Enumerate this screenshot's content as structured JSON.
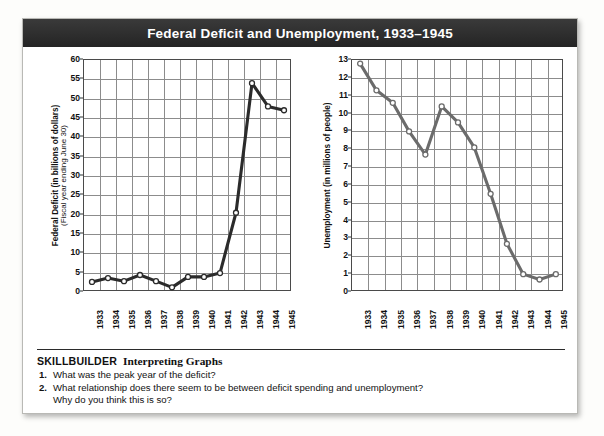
{
  "header": {
    "title": "Federal Deficit and Unemployment, 1933–1945"
  },
  "left_axis": {
    "title": "Federal Deficit (in billions of dollars)",
    "subtitle": "(Fiscal year ending June 30)"
  },
  "right_axis": {
    "title": "Unemployment (in millions of people)"
  },
  "footer": {
    "skillbuilder_label": "SKILLBUILDER",
    "skillbuilder_topic": "Interpreting Graphs",
    "questions": [
      {
        "num": "1.",
        "text": "What was the peak year of the deficit?"
      },
      {
        "num": "2.",
        "text": "What relationship does there seem to be between deficit spending and unemployment?"
      }
    ],
    "question2_line2": "Why do you think this is so?"
  },
  "chart_data": [
    {
      "type": "line",
      "id": "federal-deficit",
      "title": "Federal Deficit (in billions of dollars)",
      "xlabel": "",
      "ylabel": "Federal Deficit (in billions of dollars) (Fiscal year ending June 30)",
      "categories": [
        "1933",
        "1934",
        "1935",
        "1936",
        "1937",
        "1938",
        "1939",
        "1940",
        "1941",
        "1942",
        "1943",
        "1944",
        "1945"
      ],
      "values": [
        2.6,
        3.6,
        2.8,
        4.4,
        2.8,
        1.2,
        3.9,
        3.9,
        4.9,
        20.5,
        54.0,
        48.0,
        47.0
      ],
      "ylim": [
        0,
        60
      ],
      "yticks": [
        0,
        5,
        10,
        15,
        20,
        25,
        30,
        35,
        40,
        45,
        50,
        55,
        60
      ],
      "grid": true,
      "legend": "none",
      "marker": "open-circle",
      "line_color": "#2b2b2b"
    },
    {
      "type": "line",
      "id": "unemployment",
      "title": "Unemployment (in millions of people)",
      "xlabel": "",
      "ylabel": "Unemployment (in millions of people)",
      "categories": [
        "1933",
        "1934",
        "1935",
        "1936",
        "1937",
        "1938",
        "1939",
        "1940",
        "1941",
        "1942",
        "1943",
        "1944",
        "1945"
      ],
      "values": [
        12.8,
        11.3,
        10.6,
        9.0,
        7.7,
        10.4,
        9.5,
        8.1,
        5.5,
        2.7,
        1.0,
        0.7,
        1.0
      ],
      "ylim": [
        0,
        13
      ],
      "yticks": [
        0,
        1,
        2,
        3,
        4,
        5,
        6,
        7,
        8,
        9,
        10,
        11,
        12,
        13
      ],
      "grid": true,
      "legend": "none",
      "marker": "open-circle",
      "line_color": "#6b6b6b"
    }
  ]
}
